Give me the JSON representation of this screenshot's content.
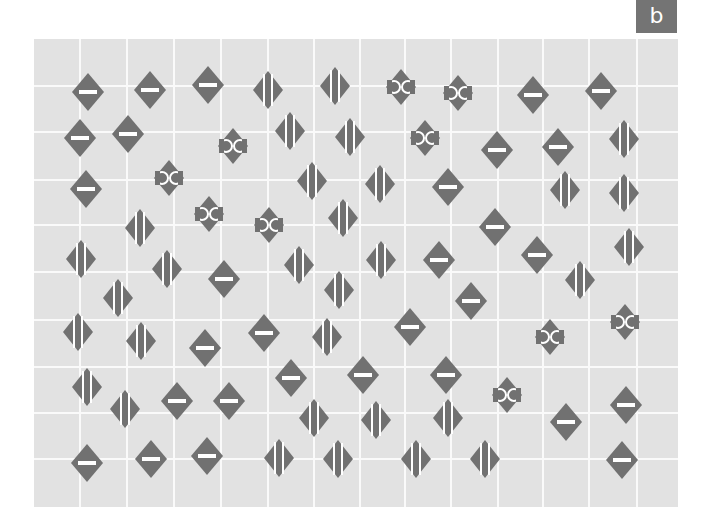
{
  "badge": {
    "label": "b"
  },
  "colors": {
    "background": "#e2e2e2",
    "gridline": "#fafafa",
    "symbol": "#717171",
    "symbol_mark": "#ffffff",
    "badge": "#747474"
  },
  "grid": {
    "vertical_lines_x": [
      80,
      127,
      174,
      221,
      268,
      314,
      360,
      405,
      451,
      498,
      543,
      589,
      637
    ],
    "horizontal_lines_y": [
      86,
      132,
      180,
      225,
      272,
      320,
      367,
      413,
      459
    ]
  },
  "symbol_types": {
    "minus": "diamond with horizontal white bar",
    "stripes": "diamond with two vertical white lines",
    "cc": "small diamond with two white ring arcs"
  },
  "symbols": [
    {
      "x": 88,
      "y": 92,
      "type": "minus"
    },
    {
      "x": 150,
      "y": 90,
      "type": "minus"
    },
    {
      "x": 208,
      "y": 85,
      "type": "minus"
    },
    {
      "x": 268,
      "y": 90,
      "type": "stripes"
    },
    {
      "x": 335,
      "y": 86,
      "type": "stripes"
    },
    {
      "x": 401,
      "y": 87,
      "type": "cc"
    },
    {
      "x": 458,
      "y": 93,
      "type": "cc"
    },
    {
      "x": 533,
      "y": 95,
      "type": "minus"
    },
    {
      "x": 601,
      "y": 91,
      "type": "minus"
    },
    {
      "x": 80,
      "y": 138,
      "type": "minus"
    },
    {
      "x": 128,
      "y": 134,
      "type": "minus"
    },
    {
      "x": 233,
      "y": 146,
      "type": "cc"
    },
    {
      "x": 290,
      "y": 131,
      "type": "stripes"
    },
    {
      "x": 350,
      "y": 137,
      "type": "stripes"
    },
    {
      "x": 425,
      "y": 138,
      "type": "cc"
    },
    {
      "x": 497,
      "y": 150,
      "type": "minus"
    },
    {
      "x": 558,
      "y": 147,
      "type": "minus"
    },
    {
      "x": 624,
      "y": 139,
      "type": "stripes"
    },
    {
      "x": 86,
      "y": 189,
      "type": "minus"
    },
    {
      "x": 169,
      "y": 178,
      "type": "cc"
    },
    {
      "x": 312,
      "y": 181,
      "type": "stripes"
    },
    {
      "x": 380,
      "y": 184,
      "type": "stripes"
    },
    {
      "x": 448,
      "y": 187,
      "type": "minus"
    },
    {
      "x": 565,
      "y": 190,
      "type": "stripes"
    },
    {
      "x": 624,
      "y": 193,
      "type": "stripes"
    },
    {
      "x": 140,
      "y": 228,
      "type": "stripes"
    },
    {
      "x": 209,
      "y": 214,
      "type": "cc"
    },
    {
      "x": 269,
      "y": 225,
      "type": "cc"
    },
    {
      "x": 343,
      "y": 218,
      "type": "stripes"
    },
    {
      "x": 495,
      "y": 227,
      "type": "minus"
    },
    {
      "x": 81,
      "y": 259,
      "type": "stripes"
    },
    {
      "x": 167,
      "y": 269,
      "type": "stripes"
    },
    {
      "x": 224,
      "y": 279,
      "type": "minus"
    },
    {
      "x": 299,
      "y": 265,
      "type": "stripes"
    },
    {
      "x": 381,
      "y": 260,
      "type": "stripes"
    },
    {
      "x": 439,
      "y": 260,
      "type": "minus"
    },
    {
      "x": 537,
      "y": 255,
      "type": "minus"
    },
    {
      "x": 629,
      "y": 247,
      "type": "stripes"
    },
    {
      "x": 580,
      "y": 280,
      "type": "stripes"
    },
    {
      "x": 118,
      "y": 298,
      "type": "stripes"
    },
    {
      "x": 339,
      "y": 290,
      "type": "stripes"
    },
    {
      "x": 471,
      "y": 301,
      "type": "minus"
    },
    {
      "x": 78,
      "y": 332,
      "type": "stripes"
    },
    {
      "x": 141,
      "y": 341,
      "type": "stripes"
    },
    {
      "x": 205,
      "y": 348,
      "type": "minus"
    },
    {
      "x": 264,
      "y": 333,
      "type": "minus"
    },
    {
      "x": 327,
      "y": 337,
      "type": "stripes"
    },
    {
      "x": 410,
      "y": 327,
      "type": "minus"
    },
    {
      "x": 550,
      "y": 337,
      "type": "cc"
    },
    {
      "x": 625,
      "y": 322,
      "type": "cc"
    },
    {
      "x": 87,
      "y": 387,
      "type": "stripes"
    },
    {
      "x": 291,
      "y": 378,
      "type": "minus"
    },
    {
      "x": 363,
      "y": 375,
      "type": "minus"
    },
    {
      "x": 446,
      "y": 375,
      "type": "minus"
    },
    {
      "x": 507,
      "y": 395,
      "type": "cc"
    },
    {
      "x": 125,
      "y": 409,
      "type": "stripes"
    },
    {
      "x": 177,
      "y": 401,
      "type": "minus"
    },
    {
      "x": 229,
      "y": 401,
      "type": "minus"
    },
    {
      "x": 314,
      "y": 418,
      "type": "stripes"
    },
    {
      "x": 376,
      "y": 420,
      "type": "stripes"
    },
    {
      "x": 448,
      "y": 418,
      "type": "stripes"
    },
    {
      "x": 566,
      "y": 422,
      "type": "minus"
    },
    {
      "x": 626,
      "y": 405,
      "type": "minus"
    },
    {
      "x": 87,
      "y": 463,
      "type": "minus"
    },
    {
      "x": 151,
      "y": 459,
      "type": "minus"
    },
    {
      "x": 207,
      "y": 456,
      "type": "minus"
    },
    {
      "x": 279,
      "y": 458,
      "type": "stripes"
    },
    {
      "x": 338,
      "y": 459,
      "type": "stripes"
    },
    {
      "x": 416,
      "y": 459,
      "type": "stripes"
    },
    {
      "x": 485,
      "y": 459,
      "type": "stripes"
    },
    {
      "x": 622,
      "y": 460,
      "type": "minus"
    }
  ]
}
